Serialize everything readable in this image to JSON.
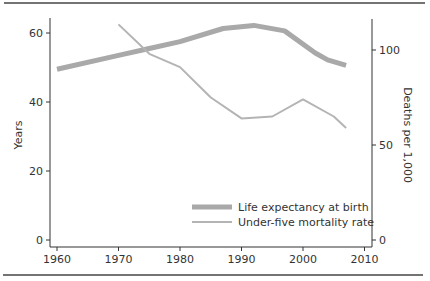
{
  "chart_data": {
    "type": "line",
    "title": "",
    "xlabel": "",
    "ylabel": "Years",
    "ylabel_right": "Deaths per 1,000",
    "xlim": [
      1959,
      2011
    ],
    "ylim": [
      0,
      65
    ],
    "ylim_right": [
      0,
      120
    ],
    "x_ticks": [
      1960,
      1970,
      1980,
      1990,
      2000,
      2010
    ],
    "y_ticks": [
      0,
      20,
      40,
      60
    ],
    "y_ticks_right": [
      0,
      50,
      100
    ],
    "grid": false,
    "legend_position": "lower right (inside plot)",
    "series": [
      {
        "name": "Life expectancy at birth",
        "axis": "left",
        "color": "#a9a9a9",
        "width": 5,
        "x": [
          1960,
          1970,
          1975,
          1980,
          1987,
          1992,
          1997,
          2002,
          2004,
          2007
        ],
        "values": [
          49.5,
          53.5,
          55.5,
          57.5,
          61.3,
          62.2,
          60.6,
          54.2,
          52.2,
          50.6
        ]
      },
      {
        "name": "Under-five mortality rate",
        "axis": "right",
        "color": "#b4b4b4",
        "width": 2,
        "x": [
          1970,
          1975,
          1980,
          1985,
          1990,
          1995,
          2000,
          2005,
          2007
        ],
        "values": [
          113.5,
          98,
          91,
          75,
          64,
          65,
          74,
          65,
          59
        ]
      }
    ]
  },
  "legend": {
    "items": [
      {
        "label": "Life expectancy at birth"
      },
      {
        "label": "Under-five mortality rate"
      }
    ]
  },
  "axes": {
    "left_title": "Years",
    "right_title": "Deaths per 1,000",
    "x_tick_labels": [
      "1960",
      "1970",
      "1980",
      "1990",
      "2000",
      "2010"
    ],
    "y_tick_labels": [
      "0",
      "20",
      "40",
      "60"
    ],
    "y_right_tick_labels": [
      "0",
      "50",
      "100"
    ]
  }
}
